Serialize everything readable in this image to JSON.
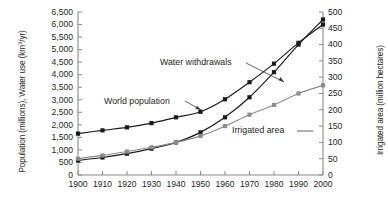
{
  "chart_data": {
    "type": "line",
    "title": "",
    "subtitle": "",
    "xlabel": "",
    "ylabel": "Population (millions), Water use (km3/yr)",
    "y2label": "Irrigated area (million hectares)",
    "xlim": [
      1900,
      2000
    ],
    "ylim": [
      0,
      6500
    ],
    "y2lim": [
      0,
      500
    ],
    "grid": false,
    "legend": "inline-annotations",
    "xticks": [
      1900,
      1910,
      1920,
      1930,
      1940,
      1950,
      1960,
      1970,
      1980,
      1990,
      2000
    ],
    "xtick_labels": [
      "1900",
      "1910",
      "1920",
      "1930",
      "1940",
      "1950",
      "1960",
      "1970",
      "1980",
      "1990",
      "2000"
    ],
    "yticks": [
      0,
      500,
      1000,
      1500,
      2000,
      2500,
      3000,
      3500,
      4000,
      4500,
      5000,
      5500,
      6000,
      6500
    ],
    "ytick_labels": [
      "0",
      "500",
      "1,000",
      "1,500",
      "2,000",
      "2,500",
      "3,000",
      "3,500",
      "4,000",
      "4,500",
      "5,000",
      "5,500",
      "6,000",
      "6,500"
    ],
    "y2ticks": [
      0,
      50,
      100,
      150,
      200,
      250,
      300,
      350,
      400,
      450,
      500
    ],
    "y2tick_labels": [
      "0",
      "50",
      "100",
      "150",
      "200",
      "250",
      "300",
      "350",
      "400",
      "450",
      "500"
    ],
    "x": [
      1900,
      1910,
      1920,
      1930,
      1940,
      1950,
      1960,
      1970,
      1980,
      1990,
      2000
    ],
    "series": [
      {
        "name": "Water withdrawals",
        "axis": "left",
        "unit": "km3/yr",
        "marker": "square",
        "color": "#1a1a1a",
        "values": [
          580,
          700,
          850,
          1050,
          1300,
          1700,
          2300,
          3100,
          4100,
          5200,
          6200
        ]
      },
      {
        "name": "World population",
        "axis": "left",
        "unit": "millions",
        "marker": "square",
        "color": "#1a1a1a",
        "values": [
          1650,
          1780,
          1900,
          2070,
          2300,
          2520,
          3020,
          3700,
          4440,
          5270,
          6000
        ]
      },
      {
        "name": "Irrigated area",
        "axis": "right",
        "unit": "million hectares",
        "marker": "square",
        "color": "#8c8c8c",
        "values": [
          50,
          60,
          72,
          85,
          100,
          120,
          150,
          185,
          215,
          250,
          275
        ]
      }
    ],
    "annotations": [
      {
        "text": "Water withdrawals",
        "x_px": 160,
        "y_px": 62,
        "points_to": "water-withdrawals-series"
      },
      {
        "text": "World population",
        "x_px": 104,
        "y_px": 97,
        "points_to": "world-population-series"
      },
      {
        "text": "Irrigated area",
        "x_px": 232,
        "y_px": 130,
        "points_to": "irrigated-area-series"
      }
    ]
  }
}
